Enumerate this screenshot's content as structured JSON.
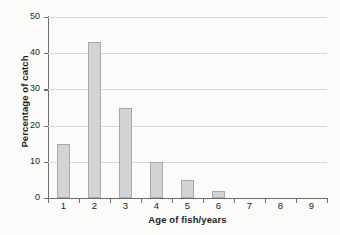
{
  "chart_data": {
    "type": "bar",
    "title": "",
    "subtitle": "",
    "xlabel": "Age of fish/years",
    "ylabel": "Percentage of catch",
    "categories": [
      "1",
      "2",
      "3",
      "4",
      "5",
      "6",
      "7",
      "8",
      "9"
    ],
    "values": [
      15,
      43,
      25,
      10,
      5,
      2,
      0,
      0,
      0
    ],
    "ylim": [
      0,
      50
    ],
    "yticks": [
      0,
      10,
      20,
      30,
      40,
      50
    ],
    "ytick_labels": [
      "0",
      "10",
      "20",
      "30",
      "40",
      "50"
    ],
    "grid": "horizontal",
    "legend": "none",
    "bar_fill_color": "#d3d3d3",
    "bar_border_color": "#a6a8ab",
    "axis_color": "#6d6e71",
    "gridline_color": "#d9d9d9",
    "background_color": "#fbfbfa",
    "text_color": "#231f20"
  }
}
